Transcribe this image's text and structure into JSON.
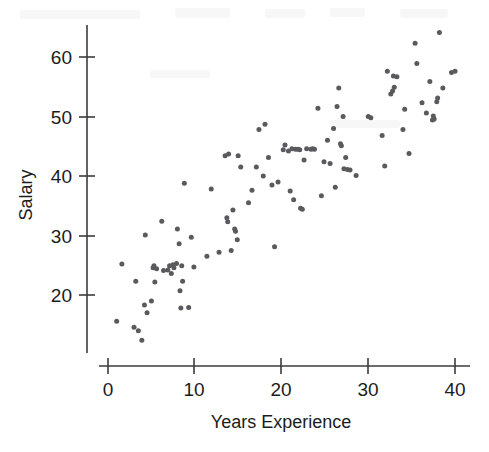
{
  "figure": {
    "title": "",
    "background_color": "#ffffff",
    "point_color": "#5a5a5e",
    "axis_color": "#3b3b3b"
  },
  "axes": {
    "x_title": "Years Experience",
    "y_title": "Salary",
    "x_ticks": [
      "0",
      "10",
      "20",
      "30",
      "40"
    ],
    "y_ticks": [
      "20",
      "30",
      "40",
      "50",
      "60"
    ]
  },
  "chart_data": {
    "type": "scatter",
    "title": "",
    "xlabel": "Years Experience",
    "ylabel": "Salary",
    "xlim": [
      -1,
      42
    ],
    "ylim": [
      11,
      67
    ],
    "xticks": [
      0,
      10,
      20,
      30,
      40
    ],
    "yticks": [
      20,
      30,
      40,
      50,
      60
    ],
    "grid": false,
    "legend": null,
    "marker": "filled-circle",
    "marker_color": "#5a5a5e",
    "marker_size_px": 5,
    "n_points": 118,
    "series": [
      {
        "name": "Employees",
        "points": [
          [
            1.0,
            15.6
          ],
          [
            1.6,
            25.2
          ],
          [
            3.0,
            14.6
          ],
          [
            3.2,
            22.3
          ],
          [
            3.5,
            14.0
          ],
          [
            3.9,
            12.4
          ],
          [
            4.2,
            18.3
          ],
          [
            4.3,
            30.1
          ],
          [
            4.5,
            17.0
          ],
          [
            5.0,
            19.0
          ],
          [
            5.2,
            24.6
          ],
          [
            5.3,
            24.9
          ],
          [
            5.4,
            22.2
          ],
          [
            5.6,
            24.4
          ],
          [
            6.2,
            32.4
          ],
          [
            6.4,
            24.1
          ],
          [
            6.9,
            24.2
          ],
          [
            7.1,
            24.9
          ],
          [
            7.3,
            23.6
          ],
          [
            7.5,
            25.1
          ],
          [
            7.6,
            24.6
          ],
          [
            7.9,
            25.3
          ],
          [
            8.0,
            31.1
          ],
          [
            8.2,
            28.6
          ],
          [
            8.3,
            20.7
          ],
          [
            8.4,
            17.8
          ],
          [
            8.5,
            24.9
          ],
          [
            8.6,
            22.3
          ],
          [
            8.8,
            38.8
          ],
          [
            9.3,
            17.9
          ],
          [
            9.6,
            29.7
          ],
          [
            9.9,
            24.7
          ],
          [
            11.4,
            26.5
          ],
          [
            11.9,
            37.8
          ],
          [
            12.8,
            27.2
          ],
          [
            13.5,
            43.4
          ],
          [
            13.7,
            33.0
          ],
          [
            13.8,
            32.3
          ],
          [
            13.9,
            43.7
          ],
          [
            14.2,
            27.5
          ],
          [
            14.4,
            34.3
          ],
          [
            14.6,
            31.1
          ],
          [
            14.7,
            30.7
          ],
          [
            14.9,
            29.3
          ],
          [
            15.0,
            43.4
          ],
          [
            15.3,
            41.5
          ],
          [
            16.2,
            35.5
          ],
          [
            16.6,
            37.6
          ],
          [
            17.1,
            41.5
          ],
          [
            17.4,
            47.8
          ],
          [
            17.9,
            40.0
          ],
          [
            18.1,
            48.7
          ],
          [
            18.5,
            43.1
          ],
          [
            18.9,
            38.5
          ],
          [
            19.2,
            28.1
          ],
          [
            19.6,
            39.0
          ],
          [
            20.2,
            44.4
          ],
          [
            20.4,
            45.2
          ],
          [
            20.8,
            44.2
          ],
          [
            21.0,
            37.5
          ],
          [
            21.2,
            44.6
          ],
          [
            21.4,
            36.0
          ],
          [
            21.6,
            44.5
          ],
          [
            21.9,
            44.5
          ],
          [
            22.1,
            44.4
          ],
          [
            22.2,
            34.6
          ],
          [
            22.4,
            34.4
          ],
          [
            22.6,
            42.7
          ],
          [
            22.9,
            44.6
          ],
          [
            23.4,
            44.5
          ],
          [
            23.6,
            44.6
          ],
          [
            23.8,
            44.5
          ],
          [
            24.2,
            51.4
          ],
          [
            24.6,
            36.7
          ],
          [
            24.9,
            42.4
          ],
          [
            25.3,
            46.0
          ],
          [
            25.6,
            42.1
          ],
          [
            26.0,
            48.0
          ],
          [
            26.2,
            38.1
          ],
          [
            26.4,
            51.7
          ],
          [
            26.6,
            54.8
          ],
          [
            26.8,
            45.4
          ],
          [
            26.9,
            45.1
          ],
          [
            27.1,
            50.0
          ],
          [
            27.2,
            41.2
          ],
          [
            27.4,
            43.1
          ],
          [
            27.6,
            41.1
          ],
          [
            27.9,
            41.0
          ],
          [
            28.6,
            40.1
          ],
          [
            30.0,
            50.0
          ],
          [
            30.3,
            49.8
          ],
          [
            31.6,
            46.8
          ],
          [
            31.9,
            41.7
          ],
          [
            32.2,
            57.6
          ],
          [
            32.6,
            53.8
          ],
          [
            32.8,
            54.3
          ],
          [
            32.9,
            56.8
          ],
          [
            33.0,
            54.9
          ],
          [
            33.3,
            56.7
          ],
          [
            34.0,
            47.8
          ],
          [
            34.2,
            51.2
          ],
          [
            34.7,
            43.8
          ],
          [
            35.4,
            62.3
          ],
          [
            35.6,
            58.9
          ],
          [
            36.2,
            52.3
          ],
          [
            36.7,
            50.6
          ],
          [
            37.1,
            55.9
          ],
          [
            37.4,
            49.4
          ],
          [
            37.5,
            50.1
          ],
          [
            37.6,
            49.6
          ],
          [
            37.9,
            52.5
          ],
          [
            38.0,
            53.1
          ],
          [
            38.2,
            64.1
          ],
          [
            38.6,
            54.8
          ],
          [
            39.6,
            57.4
          ],
          [
            40.0,
            57.6
          ]
        ]
      }
    ]
  }
}
